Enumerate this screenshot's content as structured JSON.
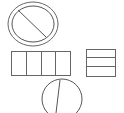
{
  "canvas": {
    "width": 124,
    "height": 113,
    "background": "#ffffff"
  },
  "colors": {
    "stroke": "#555555"
  },
  "shapes": {
    "prohibited_circle": {
      "outer": {
        "cx": 33,
        "cy": 24,
        "rx": 25,
        "ry": 22
      },
      "inner": {
        "cx": 33,
        "cy": 24,
        "rx": 21,
        "ry": 18
      },
      "slash": {
        "x1": 18,
        "y1": 10,
        "x2": 46,
        "y2": 37
      }
    },
    "four_cell_grid": {
      "x": 11,
      "y": 51,
      "width": 59,
      "height": 24,
      "dividers_x": [
        26,
        41,
        55
      ]
    },
    "three_row_box": {
      "x": 86,
      "y": 49,
      "width": 29,
      "height": 27,
      "dividers_y": [
        57,
        66
      ]
    },
    "split_circle": {
      "cx": 62,
      "cy": 99,
      "r": 20,
      "line": {
        "x1": 60,
        "y1": 80,
        "x2": 56,
        "y2": 113
      }
    }
  }
}
